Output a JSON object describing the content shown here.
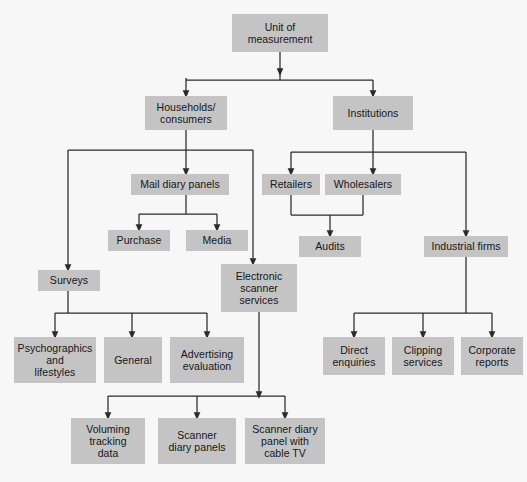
{
  "diagram": {
    "type": "flowchart",
    "palette": {
      "background": "#f7f7f7",
      "node_fill": "#c4c4c4",
      "node_text": "#15161a",
      "connector": "#2b2b2b"
    },
    "nodes": [
      {
        "id": "unit",
        "label": "Unit of\nmeasurement",
        "x": 232,
        "y": 14,
        "w": 96,
        "h": 38,
        "level": 0
      },
      {
        "id": "households",
        "label": "Households/\nconsumers",
        "x": 145,
        "y": 96,
        "w": 82,
        "h": 34,
        "level": 1
      },
      {
        "id": "institutions",
        "label": "Institutions",
        "x": 333,
        "y": 96,
        "w": 80,
        "h": 34,
        "level": 1
      },
      {
        "id": "mail",
        "label": "Mail diary panels",
        "x": 131,
        "y": 174,
        "w": 98,
        "h": 21,
        "level": 2
      },
      {
        "id": "retailers",
        "label": "Retailers",
        "x": 262,
        "y": 174,
        "w": 58,
        "h": 21,
        "level": 2
      },
      {
        "id": "wholesalers",
        "label": "Wholesalers",
        "x": 325,
        "y": 174,
        "w": 76,
        "h": 21,
        "level": 2
      },
      {
        "id": "purchase",
        "label": "Purchase",
        "x": 108,
        "y": 230,
        "w": 62,
        "h": 21,
        "level": 3
      },
      {
        "id": "media",
        "label": "Media",
        "x": 186,
        "y": 230,
        "w": 62,
        "h": 21,
        "level": 3
      },
      {
        "id": "audits",
        "label": "Audits",
        "x": 299,
        "y": 236,
        "w": 62,
        "h": 21,
        "level": 3
      },
      {
        "id": "industrial",
        "label": "Industrial firms",
        "x": 424,
        "y": 236,
        "w": 84,
        "h": 21,
        "level": 3
      },
      {
        "id": "surveys",
        "label": "Surveys",
        "x": 38,
        "y": 270,
        "w": 62,
        "h": 21,
        "level": 4
      },
      {
        "id": "scanner",
        "label": "Electronic\nscanner\nservices",
        "x": 221,
        "y": 264,
        "w": 76,
        "h": 48,
        "level": 4
      },
      {
        "id": "psycho",
        "label": "Psychographics\nand\nlifestyles",
        "x": 14,
        "y": 337,
        "w": 82,
        "h": 46,
        "level": 5
      },
      {
        "id": "general",
        "label": "General",
        "x": 104,
        "y": 337,
        "w": 58,
        "h": 46,
        "level": 5
      },
      {
        "id": "advertising",
        "label": "Advertising\nevaluation",
        "x": 170,
        "y": 337,
        "w": 74,
        "h": 46,
        "level": 5
      },
      {
        "id": "direct",
        "label": "Direct\nenquiries",
        "x": 323,
        "y": 337,
        "w": 62,
        "h": 38,
        "level": 5
      },
      {
        "id": "clipping",
        "label": "Clipping\nservices",
        "x": 392,
        "y": 337,
        "w": 62,
        "h": 38,
        "level": 5
      },
      {
        "id": "corporate",
        "label": "Corporate\nreports",
        "x": 461,
        "y": 337,
        "w": 62,
        "h": 38,
        "level": 5
      },
      {
        "id": "voluming",
        "label": "Voluming\ntracking\ndata",
        "x": 71,
        "y": 418,
        "w": 74,
        "h": 46,
        "level": 6
      },
      {
        "id": "scannerdiary",
        "label": "Scanner\ndiary panels",
        "x": 158,
        "y": 418,
        "w": 78,
        "h": 46,
        "level": 6
      },
      {
        "id": "cabletv",
        "label": "Scanner diary\npanel with\ncable TV",
        "x": 245,
        "y": 418,
        "w": 80,
        "h": 46,
        "level": 6
      }
    ],
    "edges": [
      {
        "from": "unit",
        "to": "households"
      },
      {
        "from": "unit",
        "to": "institutions"
      },
      {
        "from": "households",
        "to": "mail"
      },
      {
        "from": "households",
        "to": "surveys"
      },
      {
        "from": "households",
        "to": "scanner"
      },
      {
        "from": "mail",
        "to": "purchase"
      },
      {
        "from": "mail",
        "to": "media"
      },
      {
        "from": "institutions",
        "to": "retailers"
      },
      {
        "from": "institutions",
        "to": "wholesalers"
      },
      {
        "from": "institutions",
        "to": "industrial"
      },
      {
        "from": "retailers",
        "to": "audits"
      },
      {
        "from": "wholesalers",
        "to": "audits"
      },
      {
        "from": "surveys",
        "to": "psycho"
      },
      {
        "from": "surveys",
        "to": "general"
      },
      {
        "from": "surveys",
        "to": "advertising"
      },
      {
        "from": "industrial",
        "to": "direct"
      },
      {
        "from": "industrial",
        "to": "clipping"
      },
      {
        "from": "industrial",
        "to": "corporate"
      },
      {
        "from": "scanner",
        "to": "voluming"
      },
      {
        "from": "scanner",
        "to": "scannerdiary"
      },
      {
        "from": "scanner",
        "to": "cabletv"
      }
    ]
  }
}
